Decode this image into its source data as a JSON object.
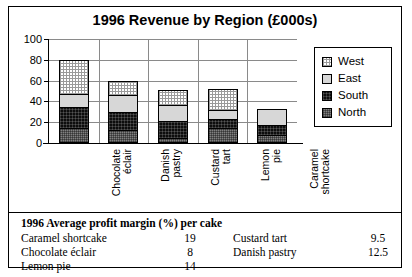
{
  "chart_data": {
    "type": "bar",
    "subtype": "stacked-column",
    "title": "1996 Revenue by Region (£000s)",
    "xlabel": "",
    "ylabel": "",
    "ylim": [
      0,
      100
    ],
    "yticks": [
      0,
      20,
      40,
      60,
      80,
      100
    ],
    "grid": true,
    "legend_position": "right",
    "categories": [
      "Chocolate éclair",
      "Danish pastry",
      "Custard tart",
      "Lemon pie",
      "Caramel shortcake"
    ],
    "category_lines": [
      [
        "Chocolate",
        "éclair"
      ],
      [
        "Danish",
        "pastry"
      ],
      [
        "Custard",
        "tart"
      ],
      [
        "Lemon",
        "pie"
      ],
      [
        "Caramel",
        "shortcake"
      ]
    ],
    "series": [
      {
        "name": "North",
        "color": "#808080",
        "values": [
          13,
          12,
          4,
          13,
          7
        ]
      },
      {
        "name": "South",
        "color": "#0d0d0d",
        "values": [
          21,
          17,
          16,
          9,
          9
        ]
      },
      {
        "name": "East",
        "color": "#d7d7d7",
        "values": [
          12,
          16,
          16,
          9,
          16
        ]
      },
      {
        "name": "West",
        "color": "#ffffff",
        "values": [
          33,
          14,
          14,
          20,
          0
        ]
      }
    ],
    "totals": [
      79,
      59,
      50,
      51,
      32
    ],
    "legend_order": [
      "West",
      "East",
      "South",
      "North"
    ]
  },
  "legend": {
    "items": [
      {
        "label": "West",
        "swatch": "west-swatch"
      },
      {
        "label": "East",
        "swatch": "east-swatch"
      },
      {
        "label": "South",
        "swatch": "south-swatch"
      },
      {
        "label": "North",
        "swatch": "north-swatch"
      }
    ]
  },
  "footnote": {
    "title": "1996 Average profit margin (%) per cake",
    "rows": [
      {
        "left_name": "Caramel shortcake",
        "left_value": "19",
        "right_name": "Custard tart",
        "right_value": "9.5"
      },
      {
        "left_name": "Chocolate éclair",
        "left_value": "8",
        "right_name": "Danish pastry",
        "right_value": "12.5"
      },
      {
        "left_name": "Lemon pie",
        "left_value": "14",
        "right_name": "",
        "right_value": ""
      }
    ]
  }
}
